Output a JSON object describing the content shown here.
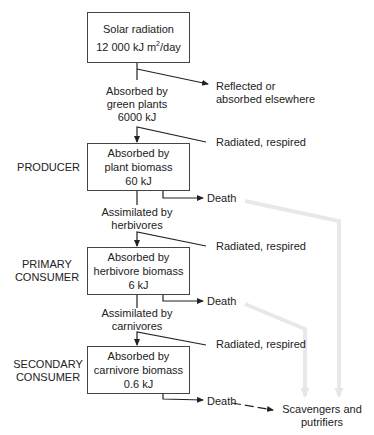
{
  "diagram": {
    "type": "energy-flow",
    "boxes": {
      "solar": {
        "line1": "Solar radiation",
        "value": "12 000 kJ m",
        "sup": "2",
        "unit": "/day"
      },
      "producer": {
        "line1": "Absorbed by",
        "line2": "plant biomass",
        "value": "60 kJ"
      },
      "primary": {
        "line1": "Absorbed by",
        "line2": "herbivore biomass",
        "value": "6 kJ"
      },
      "secondary": {
        "line1": "Absorbed by",
        "line2": "carnivore biomass",
        "value": "0.6 kJ"
      }
    },
    "levels": {
      "producer": [
        "PRODUCER"
      ],
      "primary": [
        "PRIMARY",
        "CONSUMER"
      ],
      "secondary": [
        "SECONDARY",
        "CONSUMER"
      ]
    },
    "flows": {
      "green_plants": [
        "Absorbed by",
        "green plants",
        "6000 kJ"
      ],
      "herbivores": [
        "Assimilated by",
        "herbivores"
      ],
      "carnivores": [
        "Assimilated by",
        "carnivores"
      ]
    },
    "losses": {
      "reflected": [
        "Reflected or",
        "absorbed elsewhere"
      ],
      "radiated_1": "Radiated, respired",
      "radiated_2": "Radiated, respired",
      "radiated_3": "Radiated, respired",
      "death_1": "Death",
      "death_2": "Death",
      "death_3": "Death"
    },
    "sink": [
      "Scavengers and",
      "putrifiers"
    ],
    "colors": {
      "line": "#222222",
      "gray_arrow": "#e6e6e6",
      "box_border": "#444444"
    }
  }
}
